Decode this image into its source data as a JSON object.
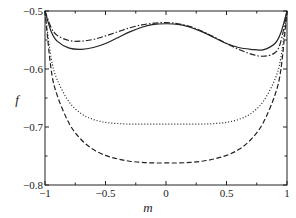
{
  "chart_data": {
    "type": "line",
    "title": "",
    "xlabel": "m",
    "ylabel": "f",
    "xlim": [
      -1,
      1
    ],
    "ylim": [
      -0.8,
      -0.5
    ],
    "xticks": [
      "-1",
      "-0.5",
      "0",
      "0.5",
      "1"
    ],
    "yticks": [
      "-0.8",
      "-0.7",
      "-0.6",
      "-0.5"
    ],
    "grid": false,
    "legend": null,
    "x": [
      -1,
      -0.95,
      -0.9,
      -0.8,
      -0.7,
      -0.6,
      -0.5,
      -0.4,
      -0.3,
      -0.2,
      -0.1,
      0,
      0.1,
      0.2,
      0.3,
      0.4,
      0.5,
      0.6,
      0.7,
      0.8,
      0.9,
      0.95,
      1
    ],
    "series": [
      {
        "name": "solid",
        "style": "solid",
        "values": [
          -0.5,
          -0.535,
          -0.552,
          -0.564,
          -0.566,
          -0.563,
          -0.556,
          -0.546,
          -0.536,
          -0.528,
          -0.523,
          -0.522,
          -0.523,
          -0.528,
          -0.536,
          -0.546,
          -0.556,
          -0.563,
          -0.566,
          -0.567,
          -0.556,
          -0.537,
          -0.5
        ]
      },
      {
        "name": "dash-dot",
        "style": "dashdot",
        "values": [
          -0.5,
          -0.528,
          -0.542,
          -0.551,
          -0.552,
          -0.549,
          -0.543,
          -0.536,
          -0.529,
          -0.524,
          -0.521,
          -0.52,
          -0.522,
          -0.527,
          -0.535,
          -0.545,
          -0.556,
          -0.566,
          -0.574,
          -0.578,
          -0.572,
          -0.552,
          -0.5
        ]
      },
      {
        "name": "dotted",
        "style": "dotted",
        "values": [
          -0.5,
          -0.58,
          -0.618,
          -0.657,
          -0.677,
          -0.687,
          -0.692,
          -0.694,
          -0.695,
          -0.695,
          -0.695,
          -0.695,
          -0.695,
          -0.695,
          -0.695,
          -0.694,
          -0.692,
          -0.687,
          -0.677,
          -0.657,
          -0.618,
          -0.58,
          -0.5
        ]
      },
      {
        "name": "dashed",
        "style": "dashed",
        "values": [
          -0.5,
          -0.6,
          -0.645,
          -0.694,
          -0.722,
          -0.739,
          -0.749,
          -0.755,
          -0.759,
          -0.761,
          -0.762,
          -0.762,
          -0.762,
          -0.761,
          -0.759,
          -0.755,
          -0.749,
          -0.739,
          -0.722,
          -0.694,
          -0.645,
          -0.6,
          -0.5
        ]
      }
    ]
  }
}
